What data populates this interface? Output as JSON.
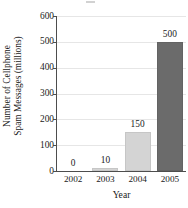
{
  "chart_data": {
    "type": "bar",
    "title": "",
    "subtitle": "",
    "xlabel": "Year",
    "ylabel": "Number of Cellphone Spam Messages (millions)",
    "ylabel_line1": "Number of Cellphone",
    "ylabel_line2": "Spam Messages (millions)",
    "categories": [
      "2002",
      "2003",
      "2004",
      "2005"
    ],
    "values": [
      0,
      10,
      150,
      500
    ],
    "value_labels": [
      "0",
      "10",
      "150",
      "500"
    ],
    "bar_colors": [
      "#ffffff",
      "#d4d4d4",
      "#d4d4d4",
      "#6b6b6b"
    ],
    "bar_styles": [
      "zero",
      "light",
      "light",
      "dark"
    ],
    "ylim": [
      0,
      600
    ],
    "yticks": [
      0,
      100,
      200,
      300,
      400,
      500,
      600
    ],
    "ytick_labels": [
      "0",
      "100",
      "200",
      "300",
      "400",
      "500",
      "600"
    ],
    "grid": true,
    "grid_axis": "y",
    "grid_color": "#e6e6e6",
    "legend": false,
    "legend_position": "none",
    "axis_color": "#4d4d4d",
    "background": "#ffffff",
    "text_color": "#1a1a1a"
  }
}
